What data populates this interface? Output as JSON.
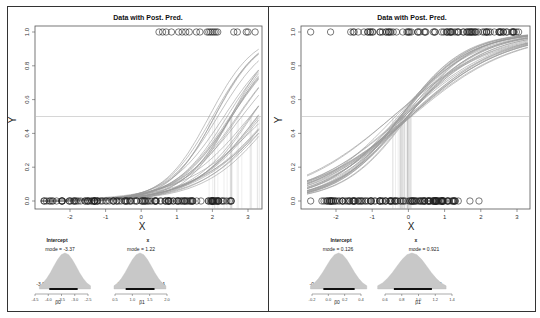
{
  "chart_data": [
    {
      "type": "scatter",
      "panel": "left",
      "title": "Data with Post. Pred.",
      "xlabel": "X",
      "ylabel": "Y",
      "xlim": [
        -2.8,
        3.3
      ],
      "ylim": [
        0,
        1
      ],
      "x_ticks": [
        -2,
        -1,
        0,
        1,
        2,
        3
      ],
      "y_ticks": [
        "0.0",
        "0.2",
        "0.4",
        "0.6",
        "0.8",
        "1.0"
      ],
      "reference_line_y": 0.5,
      "data_y1_x": [
        0.5,
        0.6,
        0.7,
        0.85,
        1.05,
        1.15,
        1.25,
        1.35,
        1.55,
        1.65,
        1.85,
        1.9,
        1.95,
        2.0,
        2.05,
        2.1,
        2.15,
        2.6,
        2.7,
        2.95,
        3.0,
        3.2
      ],
      "data_y0_x_range": [
        -2.75,
        2.55
      ],
      "posterior_curves": {
        "intercept_range": [
          -3.96,
          -2.89
        ],
        "slope_range": [
          0.808,
          1.64
        ],
        "count": 30
      },
      "threshold_x_range": [
        2.2,
        3.3
      ],
      "posterior": [
        {
          "param": "Intercept",
          "symbol": "β0",
          "mode": -3.37,
          "hdi_label": "95% HDI",
          "hdi": [
            -3.96,
            -2.89
          ],
          "axis_ticks": [
            "-4.5",
            "-4.0",
            "-3.5",
            "-3.0",
            "-2.5"
          ],
          "range": [
            -4.5,
            -2.5
          ]
        },
        {
          "param": "x",
          "symbol": "β1",
          "mode": 1.22,
          "hdi_label": "95% HDI",
          "hdi": [
            0.808,
            1.64
          ],
          "axis_ticks": [
            "0.5",
            "1.0",
            "1.5",
            "2.0"
          ],
          "range": [
            0.5,
            2.0
          ]
        }
      ]
    },
    {
      "type": "scatter",
      "panel": "right",
      "title": "Data with Post. Pred.",
      "xlabel": "X",
      "ylabel": "Y",
      "xlim": [
        -2.8,
        3.3
      ],
      "ylim": [
        0,
        1
      ],
      "x_ticks": [
        -2,
        -1,
        0,
        1,
        2,
        3
      ],
      "y_ticks": [
        "0.0",
        "0.2",
        "0.4",
        "0.6",
        "0.8",
        "1.0"
      ],
      "reference_line_y": 0.5,
      "data_y1_x_range": [
        -1.6,
        3.1
      ],
      "data_y1_outliers_x": [
        -2.7,
        -2.15
      ],
      "data_y0_x_range": [
        -2.4,
        1.4
      ],
      "data_y0_outliers_x": [
        -2.7,
        1.7,
        1.95
      ],
      "posterior_curves": {
        "intercept_range": [
          -0.0607,
          0.322
        ],
        "slope_range": [
          0.706,
          1.16
        ],
        "count": 30
      },
      "threshold_x_range": [
        -0.35,
        0.05
      ],
      "posterior": [
        {
          "param": "Intercept",
          "symbol": "β0",
          "mode": 0.126,
          "hdi_label": "95% HDI",
          "hdi": [
            -0.0607,
            0.322
          ],
          "axis_ticks": [
            "-0.2",
            "0.0",
            "0.2",
            "0.4"
          ],
          "range": [
            -0.2,
            0.4
          ]
        },
        {
          "param": "x",
          "symbol": "β1",
          "mode": 0.921,
          "hdi_label": "95% HDI",
          "hdi": [
            0.706,
            1.16
          ],
          "axis_ticks": [
            "0.6",
            "0.8",
            "1.0",
            "1.2",
            "1.4"
          ],
          "range": [
            0.6,
            1.4
          ]
        }
      ]
    }
  ],
  "labels": {
    "left": {
      "title": "Data with Post. Pred.",
      "xlabel": "X",
      "ylabel": "Y",
      "post0_title": "Intercept",
      "post0_mode": "mode = -3.37",
      "post0_hdi": "95% HDI",
      "post0_lo": "-3.96",
      "post0_hi": "-2.89",
      "post0_sym": "β0",
      "post1_title": "x",
      "post1_mode": "mode = 1.22",
      "post1_hdi": "95% HDI",
      "post1_lo": "0.808",
      "post1_hi": "1.64",
      "post1_sym": "β1"
    },
    "right": {
      "title": "Data with Post. Pred.",
      "xlabel": "X",
      "ylabel": "Y",
      "post0_title": "Intercept",
      "post0_mode": "mode = 0.126",
      "post0_hdi": "95% HDI",
      "post0_lo": "-0.0607",
      "post0_hi": "0.322",
      "post0_sym": "β0",
      "post1_title": "x",
      "post1_mode": "mode = 0.921",
      "post1_hdi": "95% HDI",
      "post1_lo": "0.706",
      "post1_hi": "1.16",
      "post1_sym": "β1"
    }
  }
}
